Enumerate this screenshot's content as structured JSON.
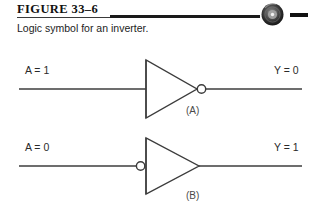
{
  "figure": {
    "title": "FIGURE 33–6",
    "caption": "Logic symbol for an inverter.",
    "media_icon": "cd-disc-icon"
  },
  "colors": {
    "background": "#ffffff",
    "line": "#3c3c3c",
    "rule_dark": "#1a1a1a",
    "text": "#1c1c1c"
  },
  "diagram": {
    "type": "logic-gate-diagram",
    "gates": [
      {
        "id": "A",
        "part_label": "(A)",
        "symbol": "inverter",
        "bubble_side": "output",
        "input_label": "A = 1",
        "output_label": "Y = 0",
        "input_value": "1",
        "output_value": "0"
      },
      {
        "id": "B",
        "part_label": "(B)",
        "symbol": "inverter",
        "bubble_side": "input",
        "input_label": "A = 0",
        "output_label": "Y = 1",
        "input_value": "0",
        "output_value": "1"
      }
    ]
  }
}
